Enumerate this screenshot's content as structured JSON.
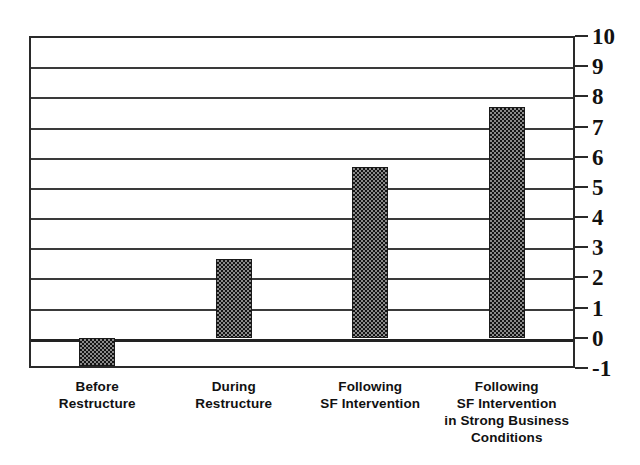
{
  "chart_data": {
    "type": "bar",
    "title": "",
    "xlabel": "",
    "ylabel": "",
    "ylim": [
      -1,
      10
    ],
    "grid": true,
    "legend": false,
    "categories": [
      "Before Restructure",
      "During Restructure",
      "Following SF Intervention",
      "Following SF Intervention in Strong Business Conditions"
    ],
    "category_lines": [
      [
        "Before",
        "Restructure"
      ],
      [
        "During",
        "Restructure"
      ],
      [
        "Following",
        "SF Intervention"
      ],
      [
        "Following",
        "SF Intervention",
        "in Strong Business",
        "Conditions"
      ]
    ],
    "values": [
      -0.95,
      2.6,
      5.65,
      7.65
    ],
    "ytick_labels": [
      "10",
      "9",
      "8",
      "7",
      "6",
      "5",
      "4",
      "3",
      "2",
      "1",
      "0",
      "-1"
    ],
    "ytick_values": [
      10,
      9,
      8,
      7,
      6,
      5,
      4,
      3,
      2,
      1,
      0,
      -1
    ],
    "colors": {
      "bar_fill": "#3b3b3b",
      "bar_edge": "#1a1a1a",
      "gridline": "#3a3a3a",
      "frame": "#2a2a2a",
      "text": "#111111",
      "background": "#ffffff"
    }
  }
}
